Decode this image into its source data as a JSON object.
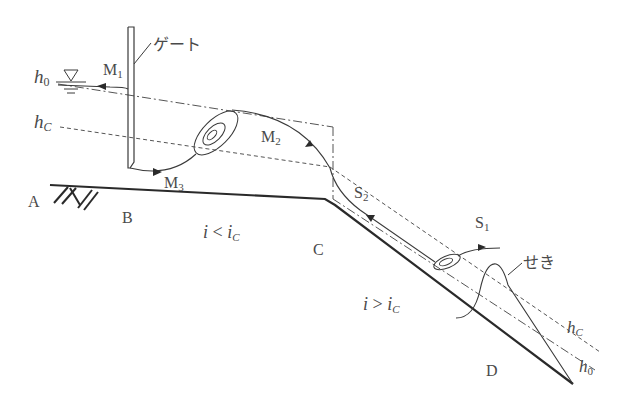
{
  "diagram": {
    "type": "open-channel water surface profiles",
    "labels": {
      "gate": "ゲート",
      "weir": "せき",
      "h0_left": "h",
      "h0_left_sub": "0",
      "hc_left": "h",
      "hc_left_sub": "C",
      "hc_right": "h",
      "hc_right_sub": "C",
      "h0_right": "h",
      "h0_right_sub": "0",
      "M1": "M",
      "M1_sub": "1",
      "M2": "M",
      "M2_sub": "2",
      "M3": "M",
      "M3_sub": "3",
      "S1": "S",
      "S1_sub": "1",
      "S2": "S",
      "S2_sub": "2",
      "A": "A",
      "B": "B",
      "C": "C",
      "D": "D",
      "mild_slope_i": "i",
      "mild_slope_op": " < ",
      "mild_slope_ic": "i",
      "mild_slope_ic_sub": "C",
      "steep_slope_i": "i",
      "steep_slope_op": " > ",
      "steep_slope_ic": "i",
      "steep_slope_ic_sub": "C"
    },
    "colors": {
      "line": "#3a3a3a",
      "bed": "#2a2a2a",
      "text": "#4a4a4a"
    }
  }
}
